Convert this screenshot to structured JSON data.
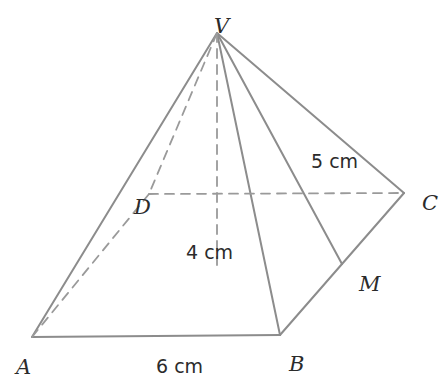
{
  "figure": {
    "type": "geometry-diagram",
    "shape": "square-pyramid",
    "canvas": {
      "width": 444,
      "height": 386,
      "background": "#ffffff"
    },
    "style": {
      "solid_edge_color": "#8c8c8c",
      "dashed_edge_color": "#9a9a9a",
      "label_color": "#2b2b2b",
      "solid_stroke_width": 2.0,
      "dashed_stroke_width": 1.8,
      "dash_pattern": "9 7"
    }
  },
  "vertices": [
    {
      "id": "V",
      "name": "apex",
      "label": "V",
      "x": 217,
      "y": 33,
      "label_x": 214,
      "label_y": 16,
      "hidden": false
    },
    {
      "id": "A",
      "name": "base-front-left",
      "label": "A",
      "x": 32,
      "y": 337,
      "label_x": 16,
      "label_y": 357,
      "hidden": false
    },
    {
      "id": "B",
      "name": "base-front-right",
      "label": "B",
      "x": 280,
      "y": 335,
      "label_x": 289,
      "label_y": 354,
      "hidden": false
    },
    {
      "id": "C",
      "name": "base-back-right",
      "label": "C",
      "x": 404,
      "y": 193,
      "label_x": 422,
      "label_y": 193,
      "hidden": false
    },
    {
      "id": "D",
      "name": "base-back-left",
      "label": "D",
      "x": 149,
      "y": 194,
      "label_x": 134,
      "label_y": 197,
      "hidden": true
    },
    {
      "id": "M",
      "name": "midpoint-of-BC",
      "label": "M",
      "x": 342,
      "y": 264,
      "label_x": 359,
      "label_y": 274,
      "hidden": false
    },
    {
      "id": "O",
      "name": "base-centre-foot",
      "label": "",
      "x": 217,
      "y": 265,
      "label_x": 0,
      "label_y": 0,
      "hidden": true
    }
  ],
  "edges": [
    {
      "id": "VA",
      "name": "lateral-edge-VA",
      "from": "V",
      "to": "A",
      "style": "solid"
    },
    {
      "id": "VB",
      "name": "lateral-edge-VB",
      "from": "V",
      "to": "B",
      "style": "solid"
    },
    {
      "id": "VC",
      "name": "lateral-edge-VC",
      "from": "V",
      "to": "C",
      "style": "solid"
    },
    {
      "id": "VM",
      "name": "slant-height-VM",
      "from": "V",
      "to": "M",
      "style": "solid"
    },
    {
      "id": "AB",
      "name": "base-edge-AB",
      "from": "A",
      "to": "B",
      "style": "solid"
    },
    {
      "id": "BC",
      "name": "base-edge-BC",
      "from": "B",
      "to": "C",
      "style": "solid"
    },
    {
      "id": "VD",
      "name": "lateral-edge-VD",
      "from": "V",
      "to": "D",
      "style": "dashed"
    },
    {
      "id": "AD",
      "name": "base-edge-AD",
      "from": "A",
      "to": "D",
      "style": "dashed"
    },
    {
      "id": "DC",
      "name": "base-diagonal-DC",
      "from": "D",
      "to": "C",
      "style": "dashed"
    },
    {
      "id": "VO",
      "name": "vertical-height-VO",
      "from": "V",
      "to": "O",
      "style": "dashed"
    }
  ],
  "measurements": [
    {
      "id": "slant",
      "name": "slant-height-measure",
      "label": "5 cm",
      "value": 5,
      "unit": "cm",
      "applies_to": "VM",
      "x": 311,
      "y": 152
    },
    {
      "id": "height",
      "name": "vertical-height-measure",
      "label": "4 cm",
      "value": 4,
      "unit": "cm",
      "applies_to": "VO",
      "x": 186,
      "y": 243
    },
    {
      "id": "base",
      "name": "base-edge-measure",
      "label": "6 cm",
      "value": 6,
      "unit": "cm",
      "applies_to": "AB",
      "x": 156,
      "y": 357
    }
  ]
}
